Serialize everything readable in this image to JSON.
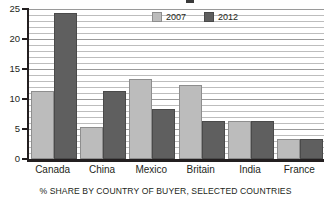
{
  "chart_data": {
    "type": "bar",
    "title": "",
    "subtitle": "",
    "caption": "% SHARE BY COUNTRY OF BUYER, SELECTED COUNTRIES",
    "xlabel": "",
    "ylabel": "",
    "categories": [
      "Canada",
      "China",
      "Mexico",
      "Britain",
      "India",
      "France"
    ],
    "series": [
      {
        "name": "2007",
        "color": "#bcbcbc",
        "values": [
          11,
          5,
          13,
          12,
          6,
          3
        ]
      },
      {
        "name": "2012",
        "color": "#5f5f5f",
        "values": [
          24,
          11,
          8,
          6,
          6,
          3
        ]
      }
    ],
    "ylim": [
      0,
      25
    ],
    "ytick_values": [
      0,
      5,
      10,
      15,
      20,
      25
    ],
    "ytick_labels": [
      "0",
      "5",
      "10",
      "15",
      "20",
      "25"
    ],
    "grid": {
      "horizontal": true,
      "horizontal_interval": 1,
      "vertical_dotted": true
    },
    "legend": {
      "position": "top-center",
      "entries": [
        {
          "label": "2007",
          "color": "#bcbcbc"
        },
        {
          "label": "2012",
          "color": "#5f5f5f"
        }
      ]
    }
  }
}
